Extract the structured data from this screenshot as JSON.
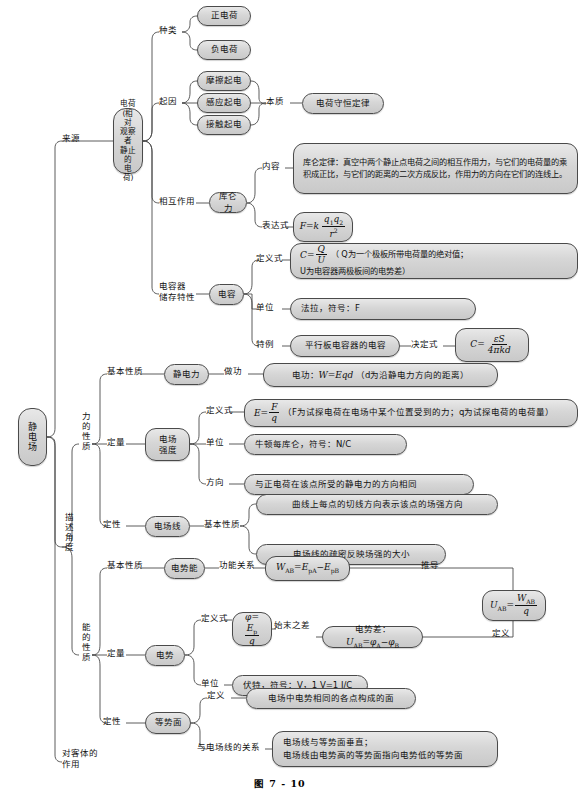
{
  "figure": {
    "caption": "图 7 - 10",
    "accent_color": "#4a4a4a",
    "node_fill": "#d6d6d6"
  },
  "root": {
    "label": "静电场"
  },
  "branches": {
    "source": "来源",
    "describe_angle": "描述角度",
    "effect_on_object": "对客体的作用"
  },
  "charge": {
    "node": "电荷\n(相对\n观察者\n静止的\n电荷)",
    "node_lines": [
      "电荷",
      "(相对",
      "观察者",
      "静止的",
      "电荷)"
    ],
    "kinds_label": "种类",
    "kinds": [
      "正电荷",
      "负电荷"
    ],
    "cause_label": "起因",
    "causes": [
      "摩擦起电",
      "感应起电",
      "接触起电"
    ],
    "essence_label": "本质",
    "essence": "电荷守恒定律",
    "interaction_label": "相互作用",
    "coulomb_force": "库仑力",
    "content_label": "内容",
    "content": "库仑定律：真空中两个静止点电荷之间的相互作用力，与它们的电荷量的乘积成正比，与它们的距离的二次方成反比，作用力的方向在它们的连线上。",
    "expression_label": "表达式",
    "expression": "F=k q1q2/r²"
  },
  "capacitor": {
    "storage_label": "电容器储存特性",
    "storage_label_lines": [
      "电容器",
      "储存特性"
    ],
    "capacitance": "电容",
    "definition_label": "定义式",
    "definition": "C=Q/U （Q为一个极板所带电荷量的绝对值；U为电容器两极板间的电势差）",
    "definition_tail_line1": "（ Q为一个极板所带电荷量的绝对值；",
    "definition_tail_line2": "U为电容器两极板间的电势差）",
    "unit_label": "单位",
    "unit": "法拉，符号：F",
    "special_label": "特例",
    "special": "平行板电容器的电容",
    "determining_label": "决定式",
    "determining": "C=εS/4πkd"
  },
  "force_property": {
    "title": "力的性质",
    "basic_label": "基本性质",
    "electrostatic_force": "静电力",
    "work_label": "做功",
    "work": "电功：W=Eqd （d为沿静电力方向的距离）",
    "work_prefix": "电功：",
    "work_tail": "（d为沿静电力方向的距离）",
    "quantitative_label": "定量",
    "field_strength": "电场强度",
    "field_strength_lines": [
      "电场",
      "强度"
    ],
    "definition_label": "定义式",
    "definition": "E=F/q （F为试探电荷在电场中某个位置受到的力；q为试探电荷的电荷量）",
    "definition_tail": "（F为试探电荷在电场中某个位置受到的力；q为试探电荷的电荷量）",
    "unit_label": "单位",
    "unit": "牛顿每库仑，符号：N/C",
    "direction_label": "方向",
    "direction": "与正电荷在该点所受的静电力的方向相同",
    "qualitative_label": "定性",
    "field_line": "电场线",
    "field_line_basic_label": "基本性质",
    "field_line_props": [
      "曲线上每点的切线方向表示该点的场强方向",
      "电场线的疏密反映场强的大小"
    ]
  },
  "energy_property": {
    "title": "能的性质",
    "basic_label": "基本性质",
    "potential_energy": "电势能",
    "work_energy_label": "功能关系",
    "work_energy": "W_AB=E_pA−E_pB",
    "derive_label": "推导",
    "derived_formula": "U_AB=W_AB/q",
    "define_label": "定义",
    "quantitative_label": "定量",
    "potential": "电势",
    "definition_label": "定义式",
    "definition": "φ=E_p/q",
    "start_end_label": "始末之差",
    "potential_difference": "电势差：U_AB=φ_A−φ_B",
    "potential_difference_prefix": "电势差：",
    "unit_label": "单位",
    "unit": "伏特，符号：V，1 V=1 J/C",
    "qualitative_label": "定性",
    "equipotential": "等势面",
    "equi_definition_label": "定义",
    "equi_definition": "电场中电势相同的各点构成的面",
    "equi_relation_label": "与电场线的关系",
    "equi_relation_lines": [
      "电场线与等势面垂直；",
      "电场线由电势高的等势面指向电势低的等势面"
    ]
  }
}
